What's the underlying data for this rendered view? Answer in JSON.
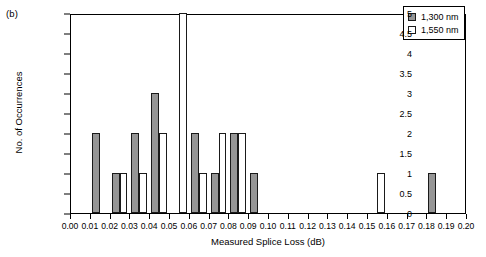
{
  "figure": {
    "panel_label": "(b)"
  },
  "legend": {
    "position": "top-right",
    "items": [
      {
        "label": "1,300 nm",
        "color": "#969696",
        "swatch": "filled-gray-square-icon"
      },
      {
        "label": "1,550 nm",
        "color": "#ffffff",
        "swatch": "hollow-white-square-icon"
      }
    ]
  },
  "chart_data": {
    "type": "bar",
    "title": "",
    "subtitle": "",
    "panel": "(b)",
    "xlabel": "Measured Splice Loss (dB)",
    "ylabel": "No. of Occurrences",
    "xlim": [
      0.0,
      0.2
    ],
    "ylim": [
      0,
      5
    ],
    "grid": false,
    "legend_position": "top-right",
    "bin_width": 0.01,
    "x_tick_labels": [
      "0.00",
      "0.01",
      "0.02",
      "0.03",
      "0.04",
      "0.05",
      "0.06",
      "0.07",
      "0.08",
      "0.09",
      "0.10",
      "0.11",
      "0.12",
      "0.13",
      "0.14",
      "0.15",
      "0.16",
      "0.17",
      "0.18",
      "0.19",
      "0.20"
    ],
    "x_tick_values": [
      0.0,
      0.01,
      0.02,
      0.03,
      0.04,
      0.05,
      0.06,
      0.07,
      0.08,
      0.09,
      0.1,
      0.11,
      0.12,
      0.13,
      0.14,
      0.15,
      0.16,
      0.17,
      0.18,
      0.19,
      0.2
    ],
    "y_tick_labels": [
      "0",
      "0.5",
      "1",
      "1.5",
      "2",
      "2.5",
      "3",
      "3.5",
      "4",
      "4.5",
      "5"
    ],
    "y_tick_values": [
      0,
      0.5,
      1,
      1.5,
      2,
      2.5,
      3,
      3.5,
      4,
      4.5,
      5
    ],
    "categories": [
      "0.00-0.01",
      "0.01-0.02",
      "0.02-0.03",
      "0.03-0.04",
      "0.04-0.05",
      "0.05-0.06",
      "0.06-0.07",
      "0.07-0.08",
      "0.08-0.09",
      "0.09-0.10",
      "0.10-0.11",
      "0.11-0.12",
      "0.12-0.13",
      "0.13-0.14",
      "0.14-0.15",
      "0.15-0.16",
      "0.16-0.17",
      "0.17-0.18",
      "0.18-0.19",
      "0.19-0.20"
    ],
    "series": [
      {
        "name": "1,300 nm",
        "color": "#969696",
        "values": [
          0,
          2,
          1,
          2,
          3,
          0,
          2,
          1,
          2,
          1,
          0,
          0,
          0,
          0,
          0,
          0,
          0,
          0,
          1,
          0
        ]
      },
      {
        "name": "1,550 nm",
        "color": "#ffffff",
        "values": [
          0,
          0,
          1,
          1,
          2,
          5,
          1,
          2,
          2,
          0,
          0,
          0,
          0,
          0,
          0,
          1,
          0,
          0,
          0,
          0
        ]
      }
    ]
  }
}
